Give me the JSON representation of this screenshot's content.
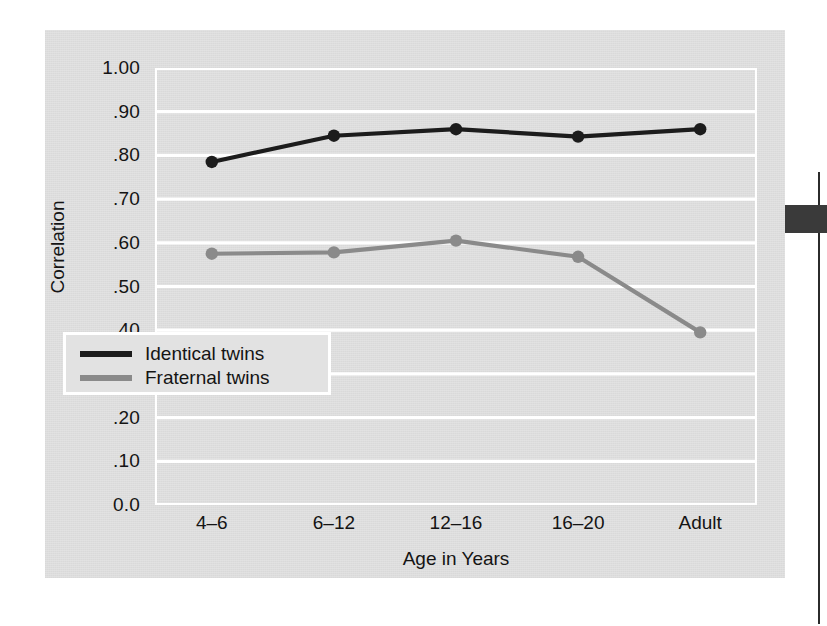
{
  "chart_data": {
    "type": "line",
    "title": "",
    "xlabel": "Age in Years",
    "ylabel": "Correlation",
    "categories": [
      "4–6",
      "6–12",
      "12–16",
      "16–20",
      "Adult"
    ],
    "ylim": [
      0.0,
      1.0
    ],
    "ytick_values": [
      1.0,
      0.9,
      0.8,
      0.7,
      0.6,
      0.5,
      0.4,
      0.3,
      0.2,
      0.1,
      0.0
    ],
    "ytick_labels": [
      "1.00",
      ".90",
      ".80",
      ".70",
      ".60",
      ".50",
      ".40",
      ".30",
      ".20",
      ".10",
      "0.0"
    ],
    "grid": "horizontal-white",
    "legend_position": "lower-left-inside",
    "series": [
      {
        "name": "Identical twins",
        "color": "#1c1c1c",
        "values": [
          0.785,
          0.845,
          0.86,
          0.843,
          0.86
        ]
      },
      {
        "name": "Fraternal twins",
        "color": "#8a8a8a",
        "values": [
          0.575,
          0.578,
          0.605,
          0.568,
          0.395
        ]
      }
    ]
  },
  "legend": {
    "items": [
      {
        "label": "Identical twins",
        "color": "#1c1c1c"
      },
      {
        "label": "Fraternal twins",
        "color": "#8a8a8a"
      }
    ]
  },
  "axes": {
    "y_title": "Correlation",
    "x_title": "Age in Years"
  },
  "colors": {
    "panel_background": "#e2e2e2",
    "page_background": "#ffffff",
    "gridline": "#ffffff",
    "identical_line": "#1c1c1c",
    "fraternal_line": "#8a8a8a",
    "text": "#141414",
    "edge_artifact": "#3a3a3a"
  }
}
